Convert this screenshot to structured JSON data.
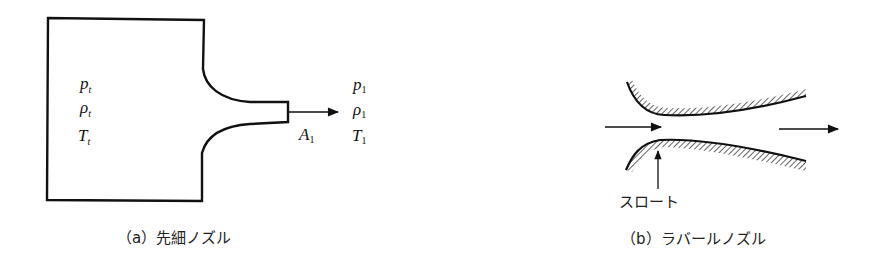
{
  "diagram_a": {
    "caption": "（a）先細ノズル",
    "reservoir_labels": [
      {
        "symbol": "p",
        "sub": "t"
      },
      {
        "symbol": "ρ",
        "sub": "t"
      },
      {
        "symbol": "T",
        "sub": "t"
      }
    ],
    "exit_area_label": {
      "symbol": "A",
      "sub": "1"
    },
    "exit_labels": [
      {
        "symbol": "p",
        "sub": "1"
      },
      {
        "symbol": "ρ",
        "sub": "1"
      },
      {
        "symbol": "T",
        "sub": "1"
      }
    ]
  },
  "diagram_b": {
    "caption": "（b）ラバールノズル",
    "throat_label": "スロート"
  },
  "colors": {
    "line": "#111111",
    "background": "#ffffff"
  }
}
